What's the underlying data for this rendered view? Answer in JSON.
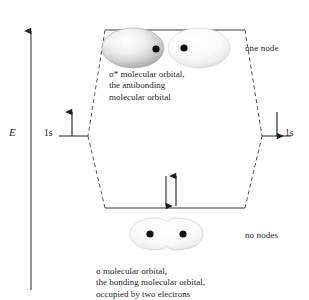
{
  "figure": {
    "type": "molecular-orbital-energy-diagram",
    "background_color": "#ffffff",
    "line_color": "#333333"
  },
  "axis": {
    "label": "E",
    "name": "energy-axis",
    "direction": "up"
  },
  "atomic_orbitals": {
    "left": {
      "label": "1s",
      "electron_arrow": "up"
    },
    "right": {
      "label": "1s",
      "electron_arrow": "down"
    }
  },
  "molecular_orbitals": {
    "antibonding": {
      "node_label": "one node",
      "caption_lines": [
        "σ* molecular orbital,",
        "the antibonding",
        "molecular  orbital"
      ],
      "lobe_left_color": "#c9c9c9",
      "lobe_right_color": "#f2f2f2",
      "nuclei_count": 2,
      "electrons": 0
    },
    "bonding": {
      "node_label": "no nodes",
      "caption_lines": [
        "σ molecular orbital,",
        "the bonding molecular orbital,",
        "occupied by two electrons"
      ],
      "lobe_color": "#f0f0f0",
      "nuclei_count": 2,
      "electrons": 2,
      "electron_arrows": [
        "down",
        "up"
      ]
    }
  }
}
